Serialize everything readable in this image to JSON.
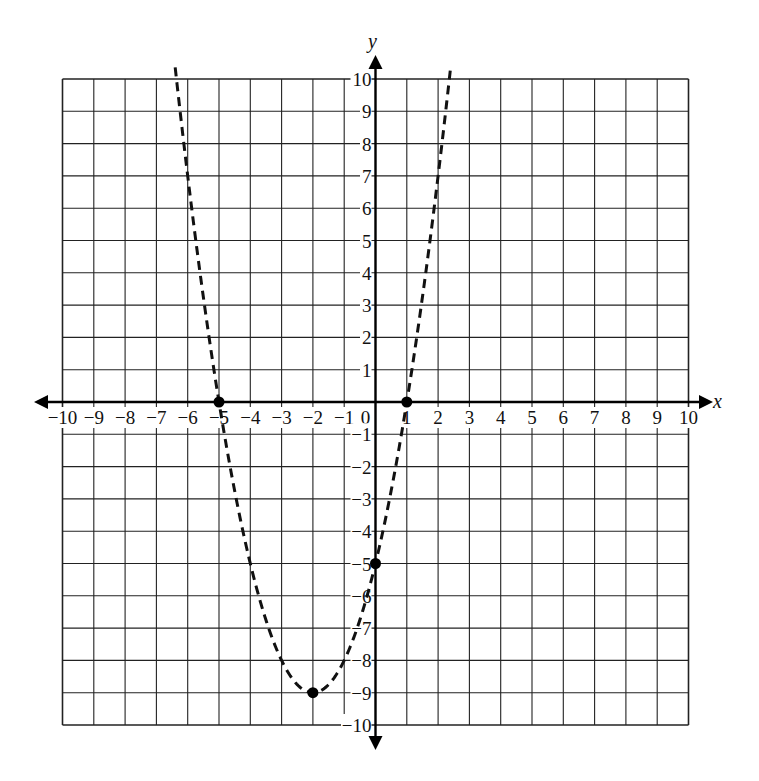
{
  "chart_data": {
    "type": "line",
    "title": "",
    "xlabel": "x",
    "ylabel": "y",
    "xlim": [
      -10,
      10
    ],
    "ylim": [
      -10,
      10
    ],
    "grid": true,
    "x_ticks": [
      -10,
      -9,
      -8,
      -7,
      -6,
      -5,
      -4,
      -3,
      -2,
      -1,
      0,
      1,
      2,
      3,
      4,
      5,
      6,
      7,
      8,
      9,
      10
    ],
    "y_ticks": [
      -10,
      -9,
      -8,
      -7,
      -6,
      -5,
      -4,
      -3,
      -2,
      -1,
      1,
      2,
      3,
      4,
      5,
      6,
      7,
      8,
      9,
      10
    ],
    "series": [
      {
        "name": "parabola y = (x+2)^2 - 9",
        "style": "dashed",
        "color": "#111111",
        "equation": {
          "a": 1,
          "h": -2,
          "k": -9
        },
        "x_range": [
          -6.4,
          2.4
        ]
      }
    ],
    "points": [
      {
        "label": "x-intercept",
        "x": -5,
        "y": 0
      },
      {
        "label": "x-intercept",
        "x": 1,
        "y": 0
      },
      {
        "label": "y-intercept",
        "x": 0,
        "y": -5
      },
      {
        "label": "vertex",
        "x": -2,
        "y": -9
      }
    ]
  },
  "layout": {
    "x0_px": 375.5,
    "y0_px": 402,
    "x_unit_px": 31.3,
    "y_unit_px": 32.3,
    "grid_color": "#222222",
    "axis_color": "#000000"
  }
}
